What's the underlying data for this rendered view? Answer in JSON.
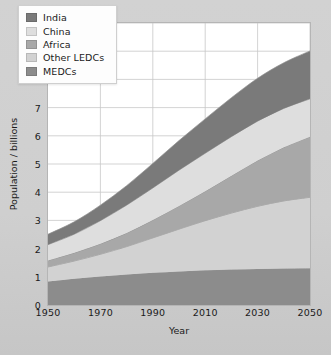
{
  "chart_data": {
    "type": "area",
    "stacked": true,
    "title": "",
    "xlabel": "Year",
    "ylabel": "Population / billions",
    "xlim": [
      1950,
      2050
    ],
    "ylim": [
      0,
      10
    ],
    "grid": true,
    "legend_position": "top-left",
    "x": [
      1950,
      1960,
      1970,
      1980,
      1990,
      2000,
      2010,
      2020,
      2030,
      2040,
      2050
    ],
    "xticks": [
      "1950",
      "1970",
      "1990",
      "2010",
      "2030",
      "2050"
    ],
    "yticks": [
      "0",
      "1",
      "2",
      "3",
      "4",
      "5",
      "6",
      "7",
      "8",
      "9",
      "10"
    ],
    "series": [
      {
        "name": "MEDCs",
        "color": "#8c8c8c",
        "values": [
          0.83,
          0.93,
          1.01,
          1.08,
          1.14,
          1.19,
          1.23,
          1.26,
          1.28,
          1.29,
          1.3
        ]
      },
      {
        "name": "Other LEDCs",
        "color": "#d2d2d2",
        "values": [
          0.52,
          0.63,
          0.79,
          0.99,
          1.24,
          1.5,
          1.76,
          2.0,
          2.22,
          2.4,
          2.52
        ]
      },
      {
        "name": "Africa",
        "color": "#a8a8a8",
        "values": [
          0.23,
          0.29,
          0.37,
          0.48,
          0.63,
          0.82,
          1.04,
          1.32,
          1.62,
          1.9,
          2.15
        ]
      },
      {
        "name": "China",
        "color": "#dedede",
        "values": [
          0.56,
          0.66,
          0.82,
          0.99,
          1.14,
          1.27,
          1.35,
          1.39,
          1.4,
          1.38,
          1.34
        ]
      },
      {
        "name": "India",
        "color": "#7a7a7a",
        "values": [
          0.37,
          0.44,
          0.55,
          0.69,
          0.87,
          1.05,
          1.22,
          1.38,
          1.52,
          1.62,
          1.7
        ]
      }
    ],
    "stack_order_bottom_to_top": [
      "MEDCs",
      "Other LEDCs",
      "Africa",
      "China",
      "India"
    ],
    "totals": [
      2.51,
      2.95,
      3.54,
      4.23,
      5.02,
      5.83,
      6.6,
      7.35,
      8.04,
      8.59,
      9.01
    ]
  },
  "legend": {
    "items": [
      {
        "label": "India",
        "color": "#7a7a7a"
      },
      {
        "label": "China",
        "color": "#dedede"
      },
      {
        "label": "Africa",
        "color": "#a8a8a8"
      },
      {
        "label": "Other LEDCs",
        "color": "#d2d2d2"
      },
      {
        "label": "MEDCs",
        "color": "#8c8c8c"
      }
    ]
  },
  "colors": {
    "plot_background": "#ffffff",
    "figure_background": "#d0d0d0",
    "gridline": "#c8c8c8",
    "axis_text": "#1a1a1a",
    "band_outline": "#8f8f8f"
  }
}
